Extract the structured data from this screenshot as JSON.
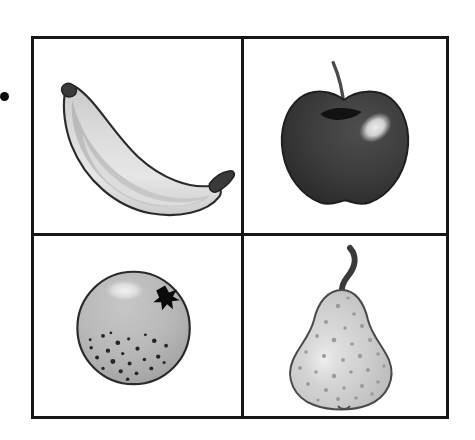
{
  "layout": {
    "width": 475,
    "height": 440,
    "background_color": "#ffffff",
    "frame": {
      "x": 31,
      "y": 36,
      "width": 418,
      "height": 383,
      "border_color": "#161616",
      "border_width": 3
    },
    "grid": {
      "rows": 2,
      "columns": 2,
      "divider_x": 241,
      "divider_y": 233
    }
  },
  "bullet": {
    "label": "bullet-marker",
    "color": "#0d0d0d",
    "x": 0,
    "y": 92,
    "size": 9
  },
  "cells": [
    {
      "position": "top-left",
      "fruit": "banana",
      "icon_name": "banana-icon",
      "colors": {
        "outline": "#2b2b2b",
        "body_light": "#e2e2e2",
        "body_mid": "#cfcfcf",
        "body_shade": "#b4b4b4",
        "tip": "#3a3a3a"
      }
    },
    {
      "position": "top-right",
      "fruit": "apple",
      "icon_name": "apple-icon",
      "colors": {
        "outline": "#1f1f1f",
        "body": "#3d3d3d",
        "body_dark": "#2e2e2e",
        "highlight": "#d6d6d6",
        "stem": "#4a4a4a",
        "stem_well": "#141414"
      }
    },
    {
      "position": "bottom-left",
      "fruit": "orange",
      "icon_name": "orange-icon",
      "colors": {
        "outline": "#2a2a2a",
        "body": "#b8b8b8",
        "body_shade": "#a5a5a5",
        "highlight": "#eaeaea",
        "speckle": "#262626",
        "star": "#0b0b0b"
      },
      "marks": {
        "star_mark": true,
        "speckle_count": 23
      }
    },
    {
      "position": "bottom-right",
      "fruit": "pear",
      "icon_name": "pear-icon",
      "colors": {
        "outline": "#4a4a4a",
        "body": "#d0d0d0",
        "body_shade": "#bdbdbd",
        "highlight": "#e8e8e8",
        "stem": "#3a3a3a",
        "speckle": "#9a9a9a"
      },
      "marks": {
        "speckle_count": 30
      }
    }
  ]
}
